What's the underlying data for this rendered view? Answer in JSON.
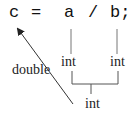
{
  "statement": {
    "tokens": [
      {
        "text": "c",
        "x": 9
      },
      {
        "text": "=",
        "x": 31
      },
      {
        "text": "a",
        "x": 64
      },
      {
        "text": "/",
        "x": 88
      },
      {
        "text": "b;",
        "x": 110
      }
    ]
  },
  "labels": {
    "assigned_type": "double",
    "operand_a_type": "int",
    "operand_b_type": "int",
    "result_type": "int"
  },
  "colors": {
    "text": "#111111",
    "line": "#333333",
    "background": "#ffffff"
  }
}
